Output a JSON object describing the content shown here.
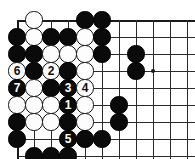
{
  "figure": {
    "name": "go-board-diagram",
    "type": "go-board",
    "width": 195,
    "height": 159,
    "background_color": "#ffffff",
    "line_color": "#2b2b2b",
    "black_color": "#0a0a0a",
    "white_color": "#fdfdfd"
  },
  "board": {
    "origin_x": 17,
    "origin_y": 20,
    "spacing": 17,
    "cols": 11,
    "rows": 9,
    "stone_radius": 8.6,
    "edges": {
      "top": true,
      "left": true,
      "right": false,
      "bottom": false
    },
    "star_points": [
      {
        "col": 8,
        "row": 3
      }
    ]
  },
  "stones": [
    {
      "col": 1,
      "row": 0,
      "color": "white",
      "label": ""
    },
    {
      "col": 4,
      "row": 0,
      "color": "black",
      "label": ""
    },
    {
      "col": 5,
      "row": 0,
      "color": "black",
      "label": ""
    },
    {
      "col": 0,
      "row": 1,
      "color": "black",
      "label": ""
    },
    {
      "col": 1,
      "row": 1,
      "color": "white",
      "label": ""
    },
    {
      "col": 2,
      "row": 1,
      "color": "black",
      "label": ""
    },
    {
      "col": 3,
      "row": 1,
      "color": "black",
      "label": ""
    },
    {
      "col": 4,
      "row": 1,
      "color": "white",
      "label": ""
    },
    {
      "col": 5,
      "row": 1,
      "color": "black",
      "label": ""
    },
    {
      "col": 0,
      "row": 2,
      "color": "black",
      "label": ""
    },
    {
      "col": 1,
      "row": 2,
      "color": "black",
      "label": ""
    },
    {
      "col": 2,
      "row": 2,
      "color": "white",
      "label": ""
    },
    {
      "col": 3,
      "row": 2,
      "color": "white",
      "label": ""
    },
    {
      "col": 4,
      "row": 2,
      "color": "white",
      "label": ""
    },
    {
      "col": 5,
      "row": 2,
      "color": "black",
      "label": ""
    },
    {
      "col": 7,
      "row": 2,
      "color": "black",
      "label": ""
    },
    {
      "col": 0,
      "row": 3,
      "color": "white",
      "label": "6"
    },
    {
      "col": 1,
      "row": 3,
      "color": "black",
      "label": ""
    },
    {
      "col": 2,
      "row": 3,
      "color": "white",
      "label": "2"
    },
    {
      "col": 3,
      "row": 3,
      "color": "black",
      "label": ""
    },
    {
      "col": 4,
      "row": 3,
      "color": "white",
      "label": ""
    },
    {
      "col": 7,
      "row": 3,
      "color": "black",
      "label": ""
    },
    {
      "col": 0,
      "row": 4,
      "color": "black",
      "label": "7"
    },
    {
      "col": 1,
      "row": 4,
      "color": "white",
      "label": ""
    },
    {
      "col": 2,
      "row": 4,
      "color": "black",
      "label": ""
    },
    {
      "col": 3,
      "row": 4,
      "color": "black",
      "label": "3"
    },
    {
      "col": 4,
      "row": 4,
      "color": "white",
      "label": "4"
    },
    {
      "col": 0,
      "row": 5,
      "color": "white",
      "label": ""
    },
    {
      "col": 1,
      "row": 5,
      "color": "white",
      "label": ""
    },
    {
      "col": 2,
      "row": 5,
      "color": "white",
      "label": ""
    },
    {
      "col": 3,
      "row": 5,
      "color": "black",
      "label": "1"
    },
    {
      "col": 4,
      "row": 5,
      "color": "white",
      "label": ""
    },
    {
      "col": 6,
      "row": 5,
      "color": "black",
      "label": ""
    },
    {
      "col": 0,
      "row": 6,
      "color": "black",
      "label": ""
    },
    {
      "col": 1,
      "row": 6,
      "color": "white",
      "label": ""
    },
    {
      "col": 2,
      "row": 6,
      "color": "white",
      "label": ""
    },
    {
      "col": 3,
      "row": 6,
      "color": "black",
      "label": ""
    },
    {
      "col": 4,
      "row": 6,
      "color": "white",
      "label": ""
    },
    {
      "col": 6,
      "row": 6,
      "color": "black",
      "label": ""
    },
    {
      "col": 0,
      "row": 7,
      "color": "black",
      "label": ""
    },
    {
      "col": 3,
      "row": 7,
      "color": "black",
      "label": "5"
    },
    {
      "col": 4,
      "row": 7,
      "color": "black",
      "label": ""
    },
    {
      "col": 5,
      "row": 7,
      "color": "black",
      "label": ""
    },
    {
      "col": 1,
      "row": 8,
      "color": "black",
      "label": ""
    },
    {
      "col": 2,
      "row": 8,
      "color": "black",
      "label": ""
    },
    {
      "col": 3,
      "row": 8,
      "color": "black",
      "label": ""
    }
  ],
  "move_sequence": [
    {
      "number": "1",
      "color": "black"
    },
    {
      "number": "2",
      "color": "white"
    },
    {
      "number": "3",
      "color": "black"
    },
    {
      "number": "4",
      "color": "white"
    },
    {
      "number": "5",
      "color": "black"
    },
    {
      "number": "6",
      "color": "white"
    },
    {
      "number": "7",
      "color": "black"
    }
  ]
}
